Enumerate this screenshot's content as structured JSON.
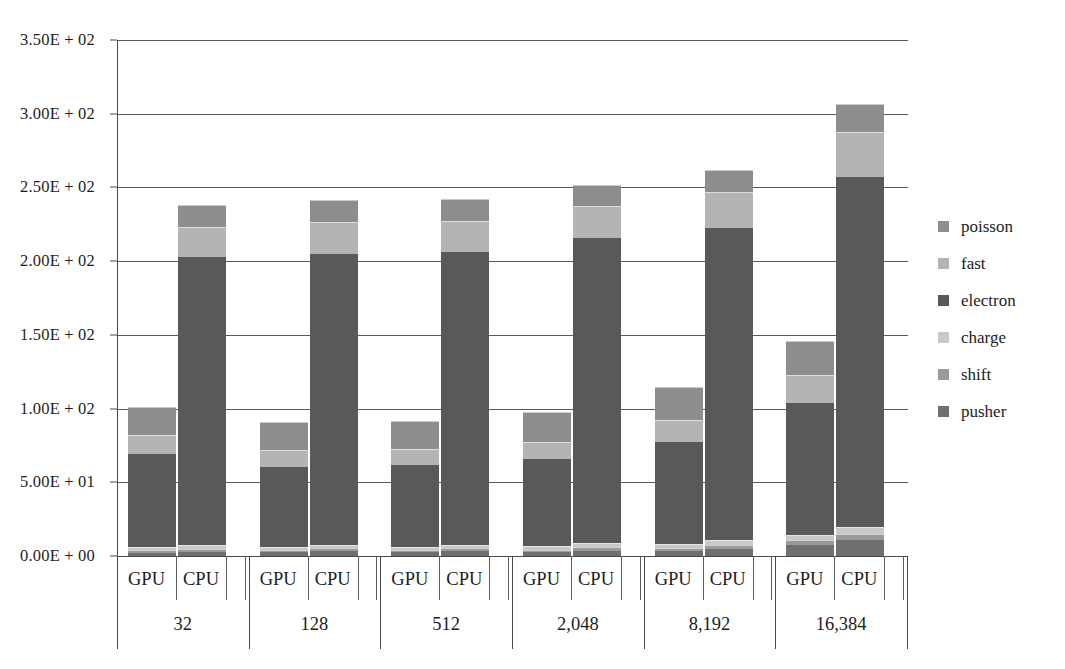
{
  "chart_data": {
    "type": "bar",
    "subtype": "stacked-bar-grouped",
    "title": "",
    "xlabel": "",
    "ylabel": "",
    "ylim": [
      0,
      350
    ],
    "ytick_values": [
      0,
      50,
      100,
      150,
      200,
      250,
      300,
      350
    ],
    "ytick_labels": [
      "0.00E + 00",
      "5.00E + 01",
      "1.00E + 02",
      "1.50E + 02",
      "2.00E + 02",
      "2.50E + 02",
      "3.00E + 02",
      "3.50E + 02"
    ],
    "grid": true,
    "grid_axis": "y",
    "legend_position": "right",
    "legend_entries": [
      "poisson",
      "fast",
      "electron",
      "charge",
      "shift",
      "pusher"
    ],
    "stack_order_bottom_to_top": [
      "pusher",
      "shift",
      "charge",
      "electron",
      "fast",
      "poisson"
    ],
    "categories": [
      "32",
      "128",
      "512",
      "2,048",
      "8,192",
      "16,384"
    ],
    "subcategories": [
      "GPU",
      "CPU"
    ],
    "series": [
      {
        "name": "pusher",
        "color": "#6f6f6f",
        "values_gpu": [
          2.2,
          2.4,
          2.4,
          2.6,
          3.4,
          7.4
        ],
        "values_cpu": [
          3.0,
          3.2,
          3.2,
          3.6,
          5.0,
          11.0
        ]
      },
      {
        "name": "shift",
        "color": "#9a9a9a",
        "values_gpu": [
          1.6,
          1.7,
          1.7,
          1.8,
          2.2,
          3.4
        ],
        "values_cpu": [
          2.0,
          2.1,
          2.1,
          2.3,
          2.8,
          4.2
        ]
      },
      {
        "name": "charge",
        "color": "#c8c8c8",
        "values_gpu": [
          2.0,
          2.1,
          2.1,
          2.2,
          2.6,
          3.8
        ],
        "values_cpu": [
          2.4,
          2.5,
          2.5,
          2.7,
          3.2,
          4.6
        ]
      },
      {
        "name": "electron",
        "color": "#595959",
        "values_gpu": [
          64.0,
          55.0,
          56.0,
          60.0,
          70.0,
          90.0
        ],
        "values_cpu": [
          196.0,
          198.0,
          199.0,
          208.0,
          212.0,
          238.0
        ]
      },
      {
        "name": "fast",
        "color": "#b4b4b4",
        "values_gpu": [
          12.0,
          10.5,
          10.5,
          11.0,
          14.0,
          18.0
        ],
        "values_cpu": [
          20.0,
          20.5,
          20.5,
          21.0,
          24.0,
          30.0
        ]
      },
      {
        "name": "poisson",
        "color": "#8d8d8d",
        "values_gpu": [
          19.0,
          19.0,
          19.0,
          20.0,
          22.5,
          23.0
        ],
        "values_cpu": [
          15.0,
          15.0,
          15.0,
          14.0,
          15.0,
          19.0
        ]
      }
    ],
    "totals_gpu": [
      100.8,
      90.7,
      91.7,
      97.6,
      114.7,
      145.6
    ],
    "totals_cpu": [
      238.4,
      241.3,
      242.3,
      251.6,
      262.0,
      306.8
    ]
  },
  "axis": {
    "y_labels": [
      "3.50E + 02",
      "3.00E + 02",
      "2.50E + 02",
      "2.00E + 02",
      "1.50E + 02",
      "1.00E + 02",
      "5.00E + 01",
      "0.00E + 00"
    ]
  },
  "groups": [
    {
      "label": "32",
      "gpu_label": "GPU",
      "cpu_label": "CPU"
    },
    {
      "label": "128",
      "gpu_label": "GPU",
      "cpu_label": "CPU"
    },
    {
      "label": "512",
      "gpu_label": "GPU",
      "cpu_label": "CPU"
    },
    {
      "label": "2,048",
      "gpu_label": "GPU",
      "cpu_label": "CPU"
    },
    {
      "label": "8,192",
      "gpu_label": "GPU",
      "cpu_label": "CPU"
    },
    {
      "label": "16,384",
      "gpu_label": "GPU",
      "cpu_label": "CPU"
    }
  ],
  "legend": {
    "items": [
      {
        "label": "poisson",
        "color": "#8d8d8d"
      },
      {
        "label": "fast",
        "color": "#b4b4b4"
      },
      {
        "label": "electron",
        "color": "#595959"
      },
      {
        "label": "charge",
        "color": "#c8c8c8"
      },
      {
        "label": "shift",
        "color": "#9a9a9a"
      },
      {
        "label": "pusher",
        "color": "#6f6f6f"
      }
    ]
  }
}
